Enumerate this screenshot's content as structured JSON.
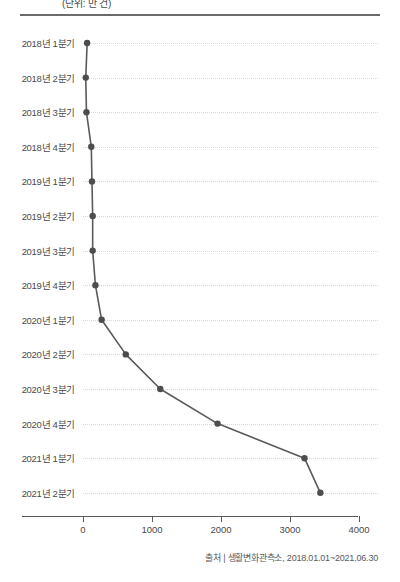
{
  "header": {
    "unit_label": "(단위: 만 건)",
    "rule": "horizontal-divider"
  },
  "source": {
    "text": "출처 | 생활변화관측소, 2018.01.01~2021.06.30"
  },
  "chart_data": {
    "type": "line",
    "orientation": "horizontal",
    "title": "",
    "subtitle": "",
    "xlabel": "",
    "ylabel": "",
    "categories": [
      "2018년 1분기",
      "2018년 2분기",
      "2018년 3분기",
      "2018년 4분기",
      "2019년 1분기",
      "2019년 2분기",
      "2019년 3분기",
      "2019년 4분기",
      "2020년 1분기",
      "2020년 2분기",
      "2020년 3분기",
      "2020년 4분기",
      "2021년 1분기",
      "2021년 2분기"
    ],
    "values": [
      60,
      40,
      50,
      120,
      130,
      140,
      140,
      180,
      270,
      620,
      1120,
      1950,
      3210,
      3440
    ],
    "xlim": [
      0,
      4200
    ],
    "xticks": [
      0,
      1000,
      2000,
      3000,
      4000
    ],
    "xtick_labels": [
      "0",
      "1000",
      "2000",
      "3000",
      "4000"
    ],
    "grid": true,
    "grid_style": "dotted-horizontal",
    "legend": false,
    "marker": "circle",
    "line_color": "#5a5a5a",
    "marker_color": "#4d4d4d",
    "grid_color": "#d8d8d8"
  }
}
